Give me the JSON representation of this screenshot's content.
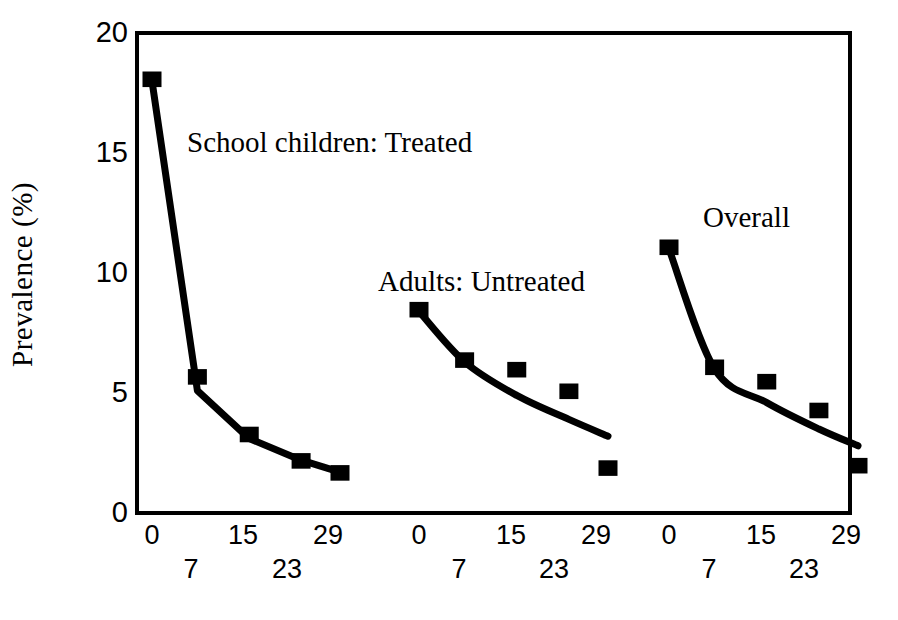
{
  "chart_data": {
    "type": "line",
    "title": "",
    "subtitle": "",
    "xlabel": "",
    "ylabel": "Prevalence (%)",
    "ylim": [
      0,
      20
    ],
    "yticks": [
      0,
      5,
      10,
      15,
      20
    ],
    "xticks": [
      0,
      7,
      15,
      23,
      29
    ],
    "xtick_rows": {
      "upper": [
        0,
        15,
        29
      ],
      "lower": [
        7,
        23
      ]
    },
    "grid": false,
    "legend_position": "inline-annotations",
    "panels": [
      {
        "name": "School children: Treated",
        "annotation": "School children: Treated",
        "x": [
          0,
          7,
          15,
          23,
          29
        ],
        "markers": [
          18.0,
          5.6,
          3.2,
          2.1,
          1.6
        ],
        "fit_line": [
          18.0,
          5.1,
          3.1,
          2.2,
          1.7
        ],
        "fit_style": "connected-segments"
      },
      {
        "name": "Adults: Untreated",
        "annotation": "Adults: Untreated",
        "x": [
          0,
          7,
          15,
          23,
          29
        ],
        "markers": [
          8.4,
          6.3,
          5.9,
          5.0,
          1.8
        ],
        "fit_line": [
          8.4,
          6.3,
          4.9,
          3.9,
          3.2
        ],
        "fit_style": "smooth-curve"
      },
      {
        "name": "Overall",
        "annotation": "Overall",
        "x": [
          0,
          7,
          15,
          23,
          29
        ],
        "markers": [
          11.0,
          6.0,
          5.4,
          4.2,
          1.9
        ],
        "fit_line": [
          11.0,
          6.0,
          4.6,
          3.5,
          2.8
        ],
        "fit_style": "smooth-curve"
      }
    ],
    "marker_shape": "filled-square",
    "marker_color": "#000000",
    "line_color": "#000000",
    "axis_color": "#000000",
    "background_color": "#ffffff"
  },
  "axes": {
    "y_label": "Prevalence (%)",
    "y_ticks": [
      "0",
      "5",
      "10",
      "15",
      "20"
    ],
    "x_ticks": [
      "0",
      "7",
      "15",
      "23",
      "29"
    ]
  },
  "annotations": {
    "panel1": "School children: Treated",
    "panel2": "Adults: Untreated",
    "panel3": "Overall"
  }
}
